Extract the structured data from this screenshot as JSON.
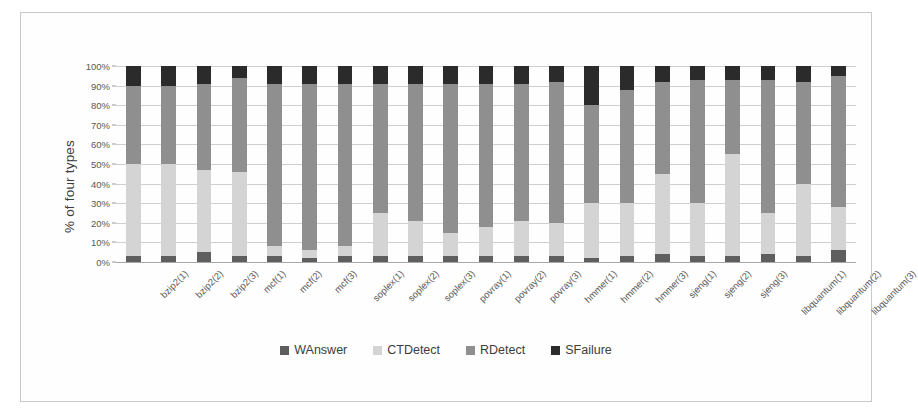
{
  "chart_data": {
    "type": "bar",
    "subtype": "stacked-bar-100-percent",
    "title": "",
    "xlabel": "",
    "ylabel": "% of four types",
    "ylim": [
      0,
      100
    ],
    "ytick_labels": [
      "0%",
      "10%",
      "20%",
      "30%",
      "40%",
      "50%",
      "60%",
      "70%",
      "80%",
      "90%",
      "100%"
    ],
    "ytick_values": [
      0,
      10,
      20,
      30,
      40,
      50,
      60,
      70,
      80,
      90,
      100
    ],
    "grid": true,
    "legend_position": "bottom",
    "stack_order_bottom_to_top": [
      "WAnswer",
      "CTDetect",
      "RDetect",
      "SFailure"
    ],
    "categories": [
      "bzip2(1)",
      "bzip2(2)",
      "bzip2(3)",
      "mcf(1)",
      "mcf(2)",
      "mcf(3)",
      "soplex(1)",
      "soplex(2)",
      "soplex(3)",
      "povray(1)",
      "povray(2)",
      "povray(3)",
      "hmmer(1)",
      "hmmer(2)",
      "hmmer(3)",
      "sjeng(1)",
      "sjeng(2)",
      "sjeng(3)",
      "libquantum(1)",
      "libquantum(2)",
      "libquantum(3)"
    ],
    "series": [
      {
        "name": "WAnswer",
        "color": "#5e5e5e",
        "values": [
          3,
          3,
          5,
          3,
          3,
          2,
          3,
          3,
          3,
          3,
          3,
          3,
          3,
          2,
          3,
          4,
          3,
          3,
          4,
          3,
          6
        ]
      },
      {
        "name": "CTDetect",
        "color": "#d4d4d4",
        "values": [
          47,
          47,
          42,
          43,
          5,
          4,
          5,
          22,
          18,
          12,
          15,
          18,
          17,
          28,
          27,
          41,
          27,
          52,
          21,
          37,
          22
        ]
      },
      {
        "name": "RDetect",
        "color": "#8f8f8f",
        "values": [
          40,
          40,
          44,
          48,
          83,
          85,
          83,
          66,
          70,
          76,
          73,
          70,
          72,
          50,
          58,
          47,
          63,
          38,
          68,
          52,
          67
        ]
      },
      {
        "name": "SFailure",
        "color": "#2b2b2b",
        "values": [
          10,
          10,
          9,
          6,
          9,
          9,
          9,
          9,
          9,
          9,
          9,
          9,
          8,
          20,
          12,
          8,
          7,
          7,
          7,
          8,
          5
        ]
      }
    ]
  },
  "legend": {
    "items": [
      {
        "label": "WAnswer",
        "color": "#5e5e5e"
      },
      {
        "label": "CTDetect",
        "color": "#d4d4d4"
      },
      {
        "label": "RDetect",
        "color": "#8f8f8f"
      },
      {
        "label": "SFailure",
        "color": "#2b2b2b"
      }
    ]
  },
  "axis": {
    "y_title": "% of four types"
  }
}
